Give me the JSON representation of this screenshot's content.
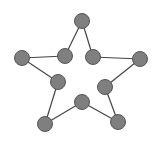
{
  "diagram": {
    "title": "",
    "type": "graph",
    "node_color": "#7f7f7f",
    "node_stroke": "#555555",
    "edge_color": "#444444",
    "node_radius": 7.5,
    "nodes": [
      {
        "id": "top",
        "x": 82,
        "y": 21
      },
      {
        "id": "inner-upper-left",
        "x": 65,
        "y": 56
      },
      {
        "id": "inner-upper-right",
        "x": 93,
        "y": 57
      },
      {
        "id": "left",
        "x": 22,
        "y": 58
      },
      {
        "id": "right",
        "x": 140,
        "y": 59
      },
      {
        "id": "inner-mid-left",
        "x": 58,
        "y": 82
      },
      {
        "id": "inner-mid-right",
        "x": 105,
        "y": 87
      },
      {
        "id": "inner-bottom",
        "x": 82,
        "y": 102
      },
      {
        "id": "bottom-left",
        "x": 45,
        "y": 124
      },
      {
        "id": "bottom-right",
        "x": 118,
        "y": 122
      }
    ],
    "edges": [
      [
        "top",
        "inner-upper-left"
      ],
      [
        "top",
        "inner-upper-right"
      ],
      [
        "inner-upper-left",
        "left"
      ],
      [
        "inner-upper-right",
        "right"
      ],
      [
        "left",
        "inner-mid-left"
      ],
      [
        "right",
        "inner-mid-right"
      ],
      [
        "inner-mid-left",
        "bottom-left"
      ],
      [
        "inner-mid-right",
        "bottom-right"
      ],
      [
        "bottom-left",
        "inner-bottom"
      ],
      [
        "bottom-right",
        "inner-bottom"
      ]
    ]
  }
}
